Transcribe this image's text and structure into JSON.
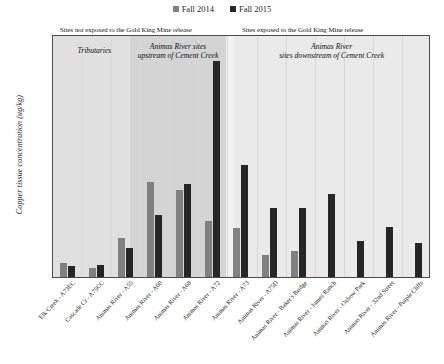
{
  "legend": {
    "position": "top-center",
    "items": [
      {
        "label": "Fall 2014",
        "color": "#808080"
      },
      {
        "label": "Fall 2015",
        "color": "#262626"
      }
    ]
  },
  "axes": {
    "ylabel": "Copper tissue concentration (ug/kg)",
    "yticks": [
      "0",
      "5,000",
      "10,000",
      "15,000",
      "20,000",
      "25,000",
      "30,000",
      "35,000",
      "40,000",
      "45,000",
      "50,000"
    ]
  },
  "annotations": {
    "not_exposed_header": "Sites not exposed to the Gold King Mine release",
    "exposed_header": "Sites exposed to the Gold King Mine release",
    "group_tributaries": "Tributaries",
    "group_upstream": "Animas River sites\nupstream of Cement Creek",
    "group_downstream": "Animas River\nsites downstream of Cement Creek"
  },
  "chart_data": {
    "type": "bar",
    "title": "",
    "xlabel": "",
    "ylabel": "Copper tissue concentration (ug/kg)",
    "ylim": [
      0,
      50000
    ],
    "ytick_step": 5000,
    "grid": "vertical",
    "legend_position": "top-center",
    "categories": [
      "Elk Creek - A73EC",
      "Cascade Cr - A75CC",
      "Animas River - A55",
      "Animas River - A60",
      "Animas River - A68",
      "Animas River - A72",
      "Animas River - A73",
      "Animas River - A75D",
      "Animas River - Baker's Bridge",
      "Animas River - James Ranch",
      "Animas River - Oxbow Park",
      "Animas River - 32nd Street",
      "Animas River - Purple Cliffs"
    ],
    "series": [
      {
        "name": "Fall 2014",
        "color": "#808080",
        "values": [
          2800,
          1900,
          8000,
          19600,
          18000,
          11500,
          10000,
          4600,
          5300,
          null,
          null,
          null,
          null
        ]
      },
      {
        "name": "Fall 2015",
        "color": "#262626",
        "values": [
          2200,
          2400,
          5900,
          12800,
          19100,
          44500,
          23100,
          14100,
          14100,
          17000,
          7400,
          10200,
          7100
        ]
      }
    ],
    "groups": [
      {
        "name": "Tributaries",
        "categories": [
          0,
          1
        ],
        "exposed": false
      },
      {
        "name": "Animas River sites upstream of Cement Creek",
        "categories": [
          2,
          3,
          4
        ],
        "exposed": false
      },
      {
        "name": "Animas River sites downstream of Cement Creek",
        "categories": [
          5,
          6,
          7,
          8,
          9,
          10,
          11,
          12
        ],
        "exposed": true
      }
    ]
  }
}
